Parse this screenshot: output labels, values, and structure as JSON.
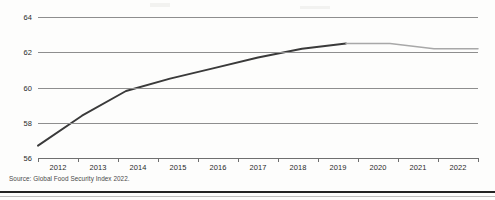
{
  "chart_data": {
    "type": "line",
    "title": "",
    "subtitle": "",
    "xlabel": "",
    "ylabel": "",
    "xlim": [
      2012,
      2022
    ],
    "ylim": [
      56,
      64
    ],
    "grid": true,
    "legend_position": "none",
    "x": [
      2012,
      2013,
      2014,
      2015,
      2016,
      2017,
      2018,
      2019,
      2020,
      2021,
      2022
    ],
    "categories": [
      "2012",
      "2013",
      "2014",
      "2015",
      "2016",
      "2017",
      "2018",
      "2019",
      "2020",
      "2021",
      "2022"
    ],
    "yticks": [
      56,
      58,
      60,
      62,
      64
    ],
    "ytick_labels": [
      "56",
      "58",
      "60",
      "62",
      "64"
    ],
    "series": [
      {
        "name": "historical",
        "color": "#3a3a3a",
        "x": [
          2012,
          2013,
          2014,
          2015,
          2016,
          2017,
          2018,
          2019
        ],
        "values": [
          56.7,
          58.4,
          59.8,
          60.5,
          61.1,
          61.7,
          62.2,
          62.5
        ]
      },
      {
        "name": "recent",
        "color": "#a8a8a8",
        "x": [
          2019,
          2020,
          2021,
          2022
        ],
        "values": [
          62.5,
          62.5,
          62.2,
          62.2
        ]
      }
    ],
    "annotations": [],
    "source": "Source: Global Food Security Index 2022."
  },
  "axes": {
    "y_tick_labels": [
      "64",
      "62",
      "60",
      "58",
      "56"
    ],
    "x_tick_labels": [
      "2012",
      "2013",
      "2014",
      "2015",
      "2016",
      "2017",
      "2018",
      "2019",
      "2020",
      "2021",
      "2022"
    ]
  },
  "footer": {
    "source": "Source: Global Food Security Index 2022."
  },
  "colors": {
    "line_historical": "#3a3a3a",
    "line_recent": "#a8a8a8",
    "gridline": "#8e8e8e",
    "axis": "#6f6f6f",
    "text": "#2a2a2a",
    "rule": "#232323"
  }
}
